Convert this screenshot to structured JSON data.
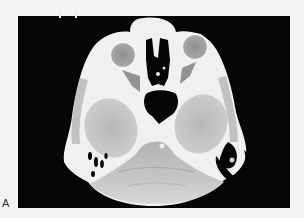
{
  "figure": {
    "panel_label": "A",
    "image_type": "axial CT scan of head",
    "colors": {
      "page_background": "#f4f4f2",
      "frame_background": "#050505",
      "bone": "#f2f2f2",
      "soft_tissue": "#c9c9c9",
      "brain_parenchyma": "#bdbdbd",
      "air": "#050505"
    }
  }
}
